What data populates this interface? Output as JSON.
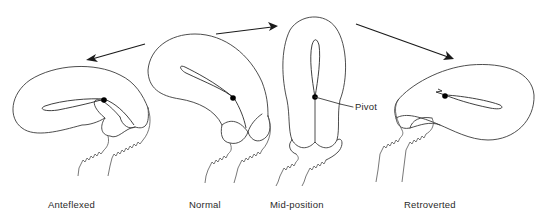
{
  "figure": {
    "positions": [
      {
        "id": "anteflexed",
        "label": "Anteflexed"
      },
      {
        "id": "normal",
        "label": "Normal"
      },
      {
        "id": "mid-position",
        "label": "Mid-position"
      },
      {
        "id": "retroverted",
        "label": "Retroverted"
      }
    ],
    "annotations": {
      "pivot_label": "Pivot"
    },
    "arrows": [
      {
        "from": "normal",
        "to": "anteflexed",
        "direction": "left"
      },
      {
        "from": "normal",
        "to": "mid-position",
        "direction": "right"
      },
      {
        "from": "mid-position",
        "to": "retroverted",
        "direction": "down-right"
      }
    ],
    "colors": {
      "background": "#ffffff",
      "line": "#3a3a3a",
      "dot": "#000000"
    }
  }
}
